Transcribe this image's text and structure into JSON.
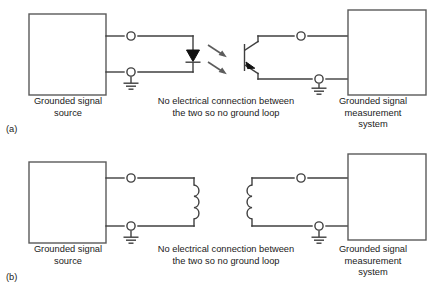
{
  "figure": {
    "panels": [
      {
        "id": "a",
        "subfigure_label": "(a)",
        "isolation_method": "optical isolation (optocoupler)",
        "left_box_label": "Grounded signal\nsource",
        "center_note": "No electrical connection between\nthe two so no ground loop",
        "right_box_label": "Grounded signal\nmeasurement\nsystem",
        "components": [
          "led",
          "light-rays",
          "phototransistor",
          "ground-symbol-left",
          "ground-symbol-right",
          "terminal-nodes"
        ],
        "terminal_count": 4,
        "ground_count": 2,
        "light_ray_count": 2
      },
      {
        "id": "b",
        "subfigure_label": "(b)",
        "isolation_method": "transformer (magnetic) isolation",
        "left_box_label": "Grounded signal\nsource",
        "center_note": "No electrical connection between\nthe two so no ground loop",
        "right_box_label": "Grounded signal\nmeasurement\nsystem",
        "components": [
          "primary-coil",
          "secondary-coil",
          "ground-symbol-left",
          "ground-symbol-right",
          "terminal-nodes"
        ],
        "terminal_count": 4,
        "ground_count": 2,
        "coil_turns": 3
      }
    ]
  },
  "colors": {
    "background": "#ffffff",
    "wire": "#3f3f3f",
    "box_stroke": "#5a5a5a",
    "solid_fill": "#111111",
    "ray": "#5c5c5c",
    "text": "#1a1a1a"
  }
}
